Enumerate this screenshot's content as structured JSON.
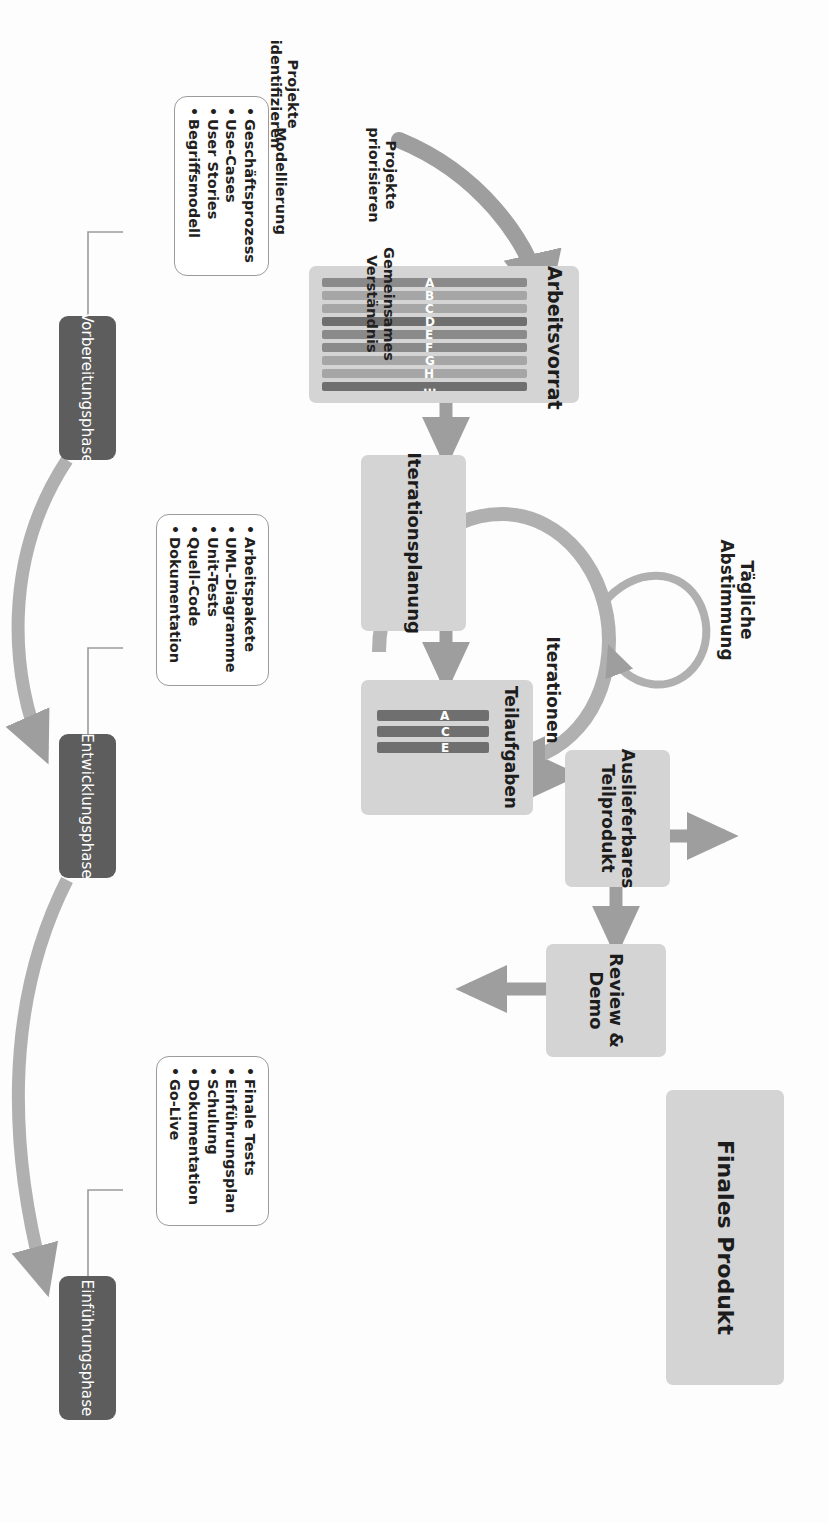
{
  "diagram": {
    "colors": {
      "box_fill": "#d4d4d4",
      "phase_fill": "#5d5d5d",
      "arrow": "#9e9e9e",
      "chip_dark": "#6f6f6f",
      "chip_mid": "#8a8a8a",
      "chip_light": "#a6a6a6",
      "outline": "#9b9b9b",
      "text": "#231f20",
      "background": "#fdfdfd"
    }
  },
  "boxes": {
    "backlog": {
      "title": "Arbeitsvorrat",
      "items": [
        "A",
        "B",
        "C",
        "D",
        "E",
        "F",
        "G",
        "H",
        "..."
      ]
    },
    "subtasks": {
      "title": "Teilaufgaben",
      "items": [
        "A",
        "C",
        "E"
      ]
    },
    "iteration_planning": {
      "title": "Iterationsplanung"
    },
    "deliverable": {
      "title": "Auslieferbares\nTeilprodukt",
      "line1": "Auslieferbares",
      "line2": "Teilprodukt"
    },
    "review_demo": {
      "title": "Review &\nDemo",
      "line1": "Review &",
      "line2": "Demo"
    },
    "final_product": {
      "title": "Finales Produkt"
    }
  },
  "labels": {
    "identify": {
      "line1": "Projekte",
      "line2": "identifizieren"
    },
    "prioritize": {
      "line1": "Projekte",
      "line2": "priorisieren"
    },
    "modelling": {
      "line1": "Modellierung"
    },
    "shared_understanding": {
      "line1": "Gemeinsames",
      "line2": "Verständnis"
    },
    "daily": {
      "line1": "Tägliche",
      "line2": "Abstimmung"
    },
    "iterations": {
      "line1": "Iterationen"
    }
  },
  "phases": [
    {
      "id": "vorbereitungsphase",
      "name": "Vorbereitungsphase",
      "deliverables": [
        "Geschäftsprozess",
        "Use-Cases",
        "User Stories",
        "Begriffsmodell"
      ]
    },
    {
      "id": "entwicklungsphase",
      "name": "Entwicklungsphase",
      "deliverables": [
        "Arbeitspakete",
        "UML-Diagramme",
        "Unit-Tests",
        "Quell-Code",
        "Dokumentation"
      ]
    },
    {
      "id": "einfuehrungsphase",
      "name": "Einführungsphase",
      "deliverables": [
        "Finale Tests",
        "Einführungsplan",
        "Schulung",
        "Dokumentation",
        "Go-Live"
      ]
    }
  ]
}
